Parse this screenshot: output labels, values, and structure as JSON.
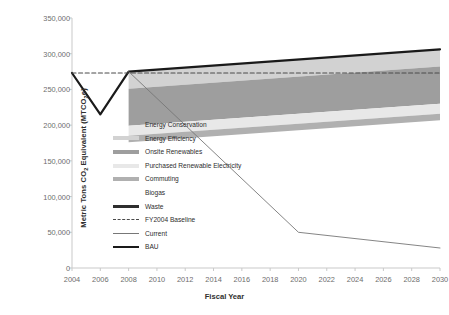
{
  "chart_data": {
    "type": "area",
    "title": "",
    "xlabel": "Fiscal Year",
    "ylabel": "Metric Tons CO2 Equivalent (MTCO2e)",
    "ylabel_parts": {
      "pre": "Metric Tons CO",
      "sub1": "2",
      "mid": " Equivalent (MTCO",
      "sub2": "2",
      "post": "e)"
    },
    "grid": false,
    "legend_position": "inside-left",
    "xlim": [
      2004,
      2030
    ],
    "ylim": [
      0,
      350000
    ],
    "x_ticks": [
      "2004",
      "2006",
      "2008",
      "2010",
      "2012",
      "2014",
      "2016",
      "2018",
      "2020",
      "2022",
      "2024",
      "2026",
      "2028",
      "2030"
    ],
    "x_tick_values": [
      2004,
      2006,
      2008,
      2010,
      2012,
      2014,
      2016,
      2018,
      2020,
      2022,
      2024,
      2026,
      2028,
      2030
    ],
    "y_ticks": [
      "0",
      "50,000",
      "100,000",
      "150,000",
      "200,000",
      "250,000",
      "300,000",
      "350,000"
    ],
    "y_tick_values": [
      0,
      50000,
      100000,
      150000,
      200000,
      250000,
      300000,
      350000
    ],
    "lines": [
      {
        "name": "BAU",
        "color": "#1a1a1a",
        "style": "solid",
        "width": 2.2,
        "x": [
          2004,
          2006,
          2008,
          2030
        ],
        "values": [
          273000,
          215000,
          275000,
          306000
        ]
      },
      {
        "name": "FY2004 Baseline",
        "color": "#4a4a4a",
        "style": "dashed",
        "width": 1.2,
        "x": [
          2004,
          2030
        ],
        "values": [
          273000,
          273000
        ]
      },
      {
        "name": "Current",
        "color": "#777777",
        "style": "solid",
        "width": 0.9,
        "x": [
          2008,
          2020,
          2030
        ],
        "values": [
          275000,
          50000,
          28000
        ]
      }
    ],
    "wedges": [
      {
        "name": "Energy Conservation",
        "color": "#ffffff",
        "x_start": 2008,
        "value_2030": 0
      },
      {
        "name": "Energy Efficiency",
        "color": "#d2d2d2",
        "x_start": 2008,
        "value_2030": 24000
      },
      {
        "name": "Onsite Renewables",
        "color": "#9e9e9e",
        "x_start": 2008,
        "value_2030": 52000
      },
      {
        "name": "Purchased Renewable Electricity",
        "color": "#e8e8e8",
        "x_start": 2008,
        "value_2030": 14000
      },
      {
        "name": "Commuting",
        "color": "#b0b0b0",
        "x_start": 2008,
        "value_2030": 9000
      },
      {
        "name": "Biogas",
        "color": "#ffffff",
        "x_start": 2008,
        "value_2030": 0
      },
      {
        "name": "Waste",
        "color": "#2e2e2e",
        "x_start": 2008,
        "value_2030": 0
      }
    ],
    "band_top_2030": 306000,
    "band_bottom_2030": 207000
  },
  "legend": {
    "items": [
      {
        "label": "Energy Conservation",
        "swatch": "none",
        "color": "#ffffff"
      },
      {
        "label": "Energy Efficiency",
        "swatch": "fill",
        "color": "#d2d2d2"
      },
      {
        "label": "Onsite Renewables",
        "swatch": "fill",
        "color": "#9e9e9e"
      },
      {
        "label": "Purchased Renewable Electricity",
        "swatch": "fill",
        "color": "#e8e8e8"
      },
      {
        "label": "Commuting",
        "swatch": "fill",
        "color": "#b0b0b0"
      },
      {
        "label": "Biogas",
        "swatch": "none",
        "color": "#ffffff"
      },
      {
        "label": "Waste",
        "swatch": "fill-thick",
        "color": "#2e2e2e"
      },
      {
        "label": "FY2004 Baseline",
        "swatch": "dashed",
        "color": "#4a4a4a"
      },
      {
        "label": "Current",
        "swatch": "line",
        "color": "#777777"
      },
      {
        "label": "BAU",
        "swatch": "line-thick",
        "color": "#1a1a1a"
      }
    ]
  },
  "axes": {
    "axis_color": "#c9c9c9",
    "tick_text_color": "#6d6d6d",
    "label_text_color": "#2f2f2f"
  }
}
